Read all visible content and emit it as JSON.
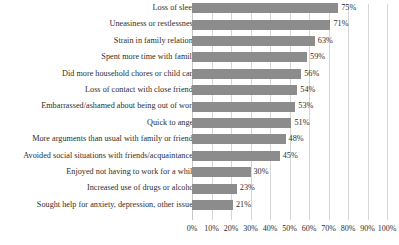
{
  "chart_data": {
    "type": "bar",
    "orientation": "horizontal",
    "title": "",
    "subtitle": "",
    "xlabel": "",
    "ylabel": "",
    "xlim": [
      0,
      100
    ],
    "grid": true,
    "legend": false,
    "value_suffix": "%",
    "categories": [
      "Loss of sleep",
      "Uneasiness or restlessness",
      "Strain in family relations",
      "Spent more time with family",
      "Did more household chores or child care",
      "Loss of contact with close friends",
      "Embarrassed/ashamed about being out of work",
      "Quick to anger",
      "More arguments than usual with family or friends",
      "Avoided social situations with friends/acquaintances",
      "Enjoyed not having to work for a while",
      "Increased use of drugs or alcohol",
      "Sought help for anxiety, depression, other issues"
    ],
    "values": [
      75,
      71,
      63,
      59,
      56,
      54,
      53,
      51,
      48,
      45,
      30,
      23,
      21
    ],
    "value_labels": [
      "75%",
      "71%",
      "63%",
      "59%",
      "56%",
      "54%",
      "53%",
      "51%",
      "48%",
      "45%",
      "30%",
      "23%",
      "21%"
    ],
    "xticks": [
      0,
      10,
      20,
      30,
      40,
      50,
      60,
      70,
      80,
      90,
      100
    ],
    "xtick_labels": [
      "0%",
      "10%",
      "20%",
      "30%",
      "40%",
      "50%",
      "60%",
      "70%",
      "80%",
      "90%",
      "100%"
    ],
    "colors": {
      "bar": "#8c8c8c",
      "grid": "#d6d6d6",
      "text": "#2d2d2d",
      "background": "#ffffff"
    }
  }
}
